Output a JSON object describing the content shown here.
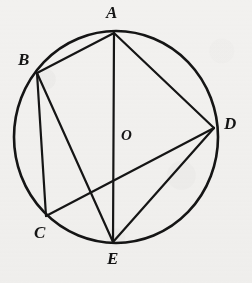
{
  "figure": {
    "background_color": "#f2f1ef",
    "ink_color": "#151515"
  },
  "circle": {
    "name": "circle",
    "cx": 116,
    "cy": 137,
    "rx": 102,
    "ry": 106,
    "stroke_width": 2.6
  },
  "center": {
    "label": "O",
    "point_x": 116,
    "point_y": 137,
    "label_x": 121,
    "label_y": 128
  },
  "points": [
    {
      "id": "A",
      "label": "A",
      "x": 114,
      "y": 33,
      "label_x": 106,
      "label_y": 4
    },
    {
      "id": "B",
      "label": "B",
      "x": 37,
      "y": 73,
      "label_x": 18,
      "label_y": 51
    },
    {
      "id": "C",
      "label": "C",
      "x": 46,
      "y": 216,
      "label_x": 34,
      "label_y": 224
    },
    {
      "id": "D",
      "label": "D",
      "x": 214,
      "y": 128,
      "label_x": 224,
      "label_y": 115
    },
    {
      "id": "E",
      "label": "E",
      "x": 113,
      "y": 242,
      "label_x": 107,
      "label_y": 250
    }
  ],
  "chords": [
    {
      "name": "chord-AB",
      "from": "A",
      "to": "B",
      "x1": 114,
      "y1": 33,
      "x2": 37,
      "y2": 73
    },
    {
      "name": "chord-AD",
      "from": "A",
      "to": "D",
      "x1": 114,
      "y1": 33,
      "x2": 214,
      "y2": 128
    },
    {
      "name": "chord-AE",
      "from": "A",
      "to": "E",
      "x1": 114,
      "y1": 33,
      "x2": 113,
      "y2": 242
    },
    {
      "name": "chord-BC",
      "from": "B",
      "to": "C",
      "x1": 37,
      "y1": 73,
      "x2": 46,
      "y2": 216
    },
    {
      "name": "chord-BE",
      "from": "B",
      "to": "E",
      "x1": 37,
      "y1": 73,
      "x2": 113,
      "y2": 242
    },
    {
      "name": "chord-CD",
      "from": "C",
      "to": "D",
      "x1": 46,
      "y1": 216,
      "x2": 214,
      "y2": 128
    },
    {
      "name": "chord-DE",
      "from": "D",
      "to": "E",
      "x1": 214,
      "y1": 128,
      "x2": 113,
      "y2": 242
    }
  ]
}
